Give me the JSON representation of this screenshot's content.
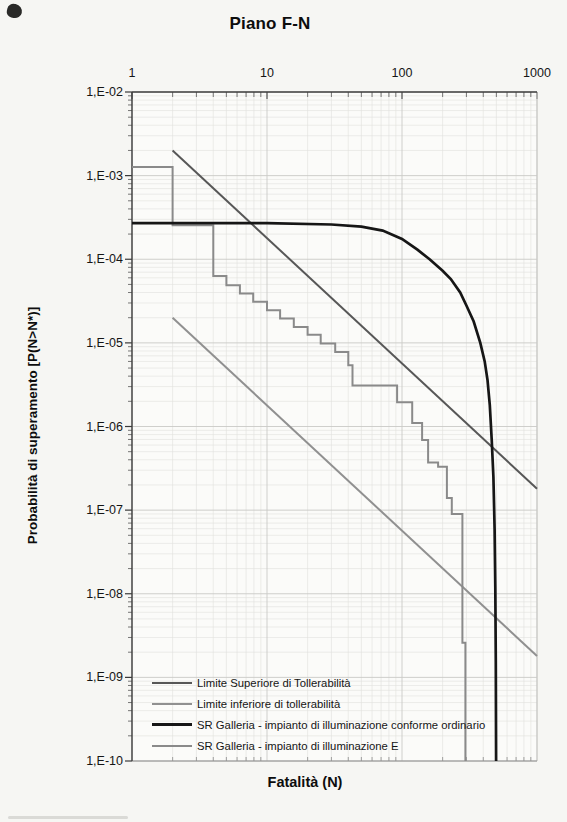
{
  "chart_data": {
    "type": "line",
    "title": "Piano F-N",
    "xlabel": "Fatalità (N)",
    "ylabel": "Probabilità di superamento [P(N>N*)]",
    "x_scale": "log",
    "y_scale": "log",
    "xlim": [
      1,
      1000
    ],
    "ylim": [
      1e-10,
      0.01
    ],
    "x_axis_position": "top",
    "grid": "log major + minor, light gray",
    "legend_position": "inside bottom-left",
    "x_ticks": [
      {
        "v": 1,
        "label": "1"
      },
      {
        "v": 10,
        "label": "10"
      },
      {
        "v": 100,
        "label": "100"
      },
      {
        "v": 1000,
        "label": "1000"
      }
    ],
    "y_ticks": [
      {
        "v": 0.01,
        "label": "1,E-02"
      },
      {
        "v": 0.001,
        "label": "1,E-03"
      },
      {
        "v": 0.0001,
        "label": "1,E-04"
      },
      {
        "v": 1e-05,
        "label": "1,E-05"
      },
      {
        "v": 1e-06,
        "label": "1,E-06"
      },
      {
        "v": 1e-07,
        "label": "1,E-07"
      },
      {
        "v": 1e-08,
        "label": "1,E-08"
      },
      {
        "v": 1e-09,
        "label": "1,E-09"
      },
      {
        "v": 1e-10,
        "label": "1,E-10"
      }
    ],
    "series": [
      {
        "id": "upper-tolerability-line",
        "name": "Limite Superiore di Tollerabilità",
        "color": "#575757",
        "width": 2,
        "points": [
          [
            2,
            0.002
          ],
          [
            1000,
            1.8e-07
          ]
        ]
      },
      {
        "id": "lower-tolerability-line",
        "name": "Limite inferiore di tollerabilità",
        "color": "#909090",
        "width": 2,
        "points": [
          [
            2,
            2e-05
          ],
          [
            1000,
            1.8e-09
          ]
        ]
      },
      {
        "id": "sr-galleria-ordinario-curve",
        "name": "SR Galleria - impianto di illuminazione conforme ordinario",
        "color": "#161616",
        "width": 2.7,
        "points": [
          [
            1,
            0.00027
          ],
          [
            10,
            0.00027
          ],
          [
            30,
            0.00026
          ],
          [
            50,
            0.000245
          ],
          [
            72,
            0.00022
          ],
          [
            100,
            0.000175
          ],
          [
            130,
            0.00013
          ],
          [
            160,
            0.0001
          ],
          [
            200,
            7.3e-05
          ],
          [
            230,
            5.8e-05
          ],
          [
            270,
            4e-05
          ],
          [
            300,
            2.8e-05
          ],
          [
            340,
            1.8e-05
          ],
          [
            380,
            1e-05
          ],
          [
            410,
            6e-06
          ],
          [
            430,
            3.6e-06
          ],
          [
            447,
            1.8e-06
          ],
          [
            462,
            7e-07
          ],
          [
            475,
            2.5e-07
          ],
          [
            485,
            6e-08
          ],
          [
            491,
            1.2e-08
          ],
          [
            495,
            1.5e-09
          ],
          [
            498,
            1e-10
          ]
        ]
      },
      {
        "id": "sr-galleria-e-curve",
        "name": "SR Galleria - impianto di illuminazione E",
        "color": "#8a8a8a",
        "width": 2,
        "points": [
          [
            1,
            0.00127
          ],
          [
            2,
            0.00127
          ],
          [
            2,
            0.000255
          ],
          [
            4,
            0.000255
          ],
          [
            4,
            6.3e-05
          ],
          [
            5,
            6.3e-05
          ],
          [
            5,
            4.9e-05
          ],
          [
            6.3,
            4.9e-05
          ],
          [
            6.3,
            3.9e-05
          ],
          [
            7.9,
            3.9e-05
          ],
          [
            7.9,
            3.1e-05
          ],
          [
            10,
            3.1e-05
          ],
          [
            10,
            2.45e-05
          ],
          [
            12.5,
            2.45e-05
          ],
          [
            12.5,
            1.95e-05
          ],
          [
            15.8,
            1.95e-05
          ],
          [
            15.8,
            1.55e-05
          ],
          [
            20,
            1.55e-05
          ],
          [
            20,
            1.25e-05
          ],
          [
            25,
            1.25e-05
          ],
          [
            25,
            9.8e-06
          ],
          [
            32,
            9.8e-06
          ],
          [
            32,
            7.8e-06
          ],
          [
            40,
            7.8e-06
          ],
          [
            40,
            5.4e-06
          ],
          [
            43,
            5.4e-06
          ],
          [
            43,
            3.1e-06
          ],
          [
            92,
            3.1e-06
          ],
          [
            92,
            1.95e-06
          ],
          [
            119,
            1.95e-06
          ],
          [
            119,
            1.1e-06
          ],
          [
            141,
            1.1e-06
          ],
          [
            141,
            6.9e-07
          ],
          [
            156,
            6.9e-07
          ],
          [
            156,
            3.7e-07
          ],
          [
            185,
            3.7e-07
          ],
          [
            185,
            3.3e-07
          ],
          [
            215,
            3.3e-07
          ],
          [
            215,
            1.4e-07
          ],
          [
            234,
            1.4e-07
          ],
          [
            234,
            9e-08
          ],
          [
            280,
            9e-08
          ],
          [
            280,
            2.6e-09
          ],
          [
            295,
            2.6e-09
          ],
          [
            295,
            1e-10
          ]
        ]
      }
    ],
    "colors": {
      "page_background": "#f6f6f3",
      "plot_background": "#fbfbf9",
      "grid_major": "#c9c9c6",
      "grid_minor": "#e1e1de",
      "axis_line": "#3f3f3f",
      "text": "#111111"
    }
  }
}
